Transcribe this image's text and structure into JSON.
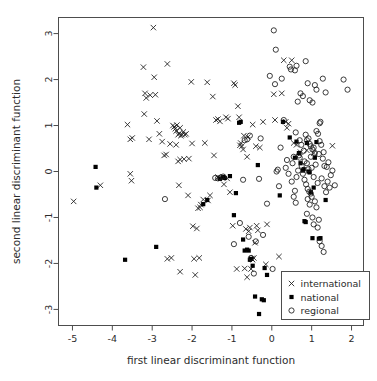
{
  "chart_data": {
    "type": "scatter",
    "title": "",
    "xlabel": "first linear discriminant function",
    "ylabel": "second linear discriminant function",
    "xlim": [
      -5.35,
      2.3
    ],
    "ylim": [
      -3.35,
      3.35
    ],
    "xticks": [
      -5,
      -4,
      -3,
      -2,
      -1,
      0,
      1,
      2
    ],
    "yticks": [
      -3,
      -2,
      -1,
      0,
      1,
      2,
      3
    ],
    "xtick_labels": [
      "-5",
      "-4",
      "-3",
      "-2",
      "-1",
      "0",
      "1",
      "2"
    ],
    "ytick_labels": [
      "-3",
      "-2",
      "-1",
      "0",
      "1",
      "2",
      "3"
    ],
    "grid": false,
    "legend_position": "bottom-right",
    "series": [
      {
        "name": "international",
        "marker": "x",
        "color": "#1a1a1a",
        "points": [
          [
            -4.97,
            -0.65
          ],
          [
            -4.3,
            -0.3
          ],
          [
            -3.62,
            1.02
          ],
          [
            -3.55,
            0.7
          ],
          [
            -3.5,
            0.73
          ],
          [
            -3.52,
            -0.2
          ],
          [
            -3.55,
            -0.05
          ],
          [
            -3.22,
            2.27
          ],
          [
            -3.2,
            1.25
          ],
          [
            -3.18,
            1.7
          ],
          [
            -3.15,
            1.6
          ],
          [
            -3.05,
            1.66
          ],
          [
            -2.97,
            3.13
          ],
          [
            -2.95,
            2.05
          ],
          [
            -2.88,
            1.1
          ],
          [
            -2.82,
            0.82
          ],
          [
            -2.75,
            0.65
          ],
          [
            -2.7,
            0.35
          ],
          [
            -2.65,
            0.37
          ],
          [
            -2.62,
            2.34
          ],
          [
            -2.48,
            1.0
          ],
          [
            -2.45,
            0.97
          ],
          [
            -2.42,
            0.93
          ],
          [
            -2.4,
            0.88
          ],
          [
            -2.38,
            1.01
          ],
          [
            -2.35,
            0.8
          ],
          [
            -2.32,
            0.83
          ],
          [
            -2.3,
            0.95
          ],
          [
            -2.28,
            0.78
          ],
          [
            -2.25,
            0.8
          ],
          [
            -2.22,
            0.86
          ],
          [
            -2.4,
            0.58
          ],
          [
            -2.35,
            0.22
          ],
          [
            -2.3,
            0.26
          ],
          [
            -2.33,
            -0.3
          ],
          [
            -2.2,
            0.27
          ],
          [
            -2.18,
            0.8
          ],
          [
            -2.15,
            0.82
          ],
          [
            -2.1,
            -0.52
          ],
          [
            -2.02,
            1.95
          ],
          [
            -2.0,
            0.61
          ],
          [
            -1.98,
            -1.19
          ],
          [
            -1.88,
            -1.24
          ],
          [
            -1.85,
            -0.8
          ],
          [
            -1.8,
            -0.78
          ],
          [
            -1.78,
            -0.72
          ],
          [
            -1.72,
            -0.61
          ],
          [
            -1.62,
            1.94
          ],
          [
            -1.6,
            -0.63
          ],
          [
            -1.48,
            1.63
          ],
          [
            -1.45,
            0.35
          ],
          [
            -1.4,
            1.12
          ],
          [
            -1.35,
            1.14
          ],
          [
            -1.3,
            1.09
          ],
          [
            -1.2,
            -0.28
          ],
          [
            -1.15,
            1.18
          ],
          [
            -1.1,
            1.15
          ],
          [
            -1.05,
            -0.45
          ],
          [
            -0.95,
            1.92
          ],
          [
            -0.92,
            1.88
          ],
          [
            -0.88,
            -2.12
          ],
          [
            -0.85,
            1.42
          ],
          [
            -0.8,
            0.57
          ],
          [
            -0.78,
            0.62
          ],
          [
            -0.75,
            0.55
          ],
          [
            -0.72,
            0.48
          ],
          [
            -0.7,
            0.78
          ],
          [
            -0.68,
            -2.11
          ],
          [
            -0.65,
            -1.25
          ],
          [
            -0.62,
            -2.3
          ],
          [
            -0.6,
            0.75
          ],
          [
            -0.58,
            -1.3
          ],
          [
            -0.55,
            -1.22
          ],
          [
            -0.52,
            -2.12
          ],
          [
            -0.5,
            -1.9
          ],
          [
            -0.48,
            -1.92
          ],
          [
            -0.45,
            -1.88
          ],
          [
            -0.42,
            -1.55
          ],
          [
            -0.4,
            0.55
          ],
          [
            -0.38,
            -1.18
          ],
          [
            -0.35,
            -1.28
          ],
          [
            -0.3,
            0.52
          ],
          [
            -0.22,
            1.08
          ],
          [
            -0.15,
            -2.02
          ],
          [
            -0.12,
            -1.15
          ],
          [
            0.05,
            1.68
          ],
          [
            0.08,
            1.12
          ],
          [
            0.18,
            -1.85
          ],
          [
            0.25,
            1.7
          ],
          [
            0.3,
            2.42
          ],
          [
            0.35,
            1.08
          ],
          [
            0.38,
            0.95
          ],
          [
            0.42,
            1.04
          ],
          [
            0.5,
            2.42
          ],
          [
            0.55,
            0.62
          ],
          [
            0.62,
            0.58
          ],
          [
            0.72,
            0.42
          ],
          [
            0.88,
            0.46
          ],
          [
            1.05,
            0.4
          ],
          [
            1.52,
            0.56
          ],
          [
            -2.92,
            1.67
          ],
          [
            -2.55,
            0.6
          ],
          [
            -1.92,
            -2.25
          ],
          [
            -1.82,
            -1.88
          ],
          [
            -2.3,
            -2.18
          ],
          [
            -2.62,
            -1.9
          ],
          [
            -2.52,
            -1.88
          ],
          [
            -1.95,
            -1.9
          ],
          [
            -0.98,
            -1.18
          ],
          [
            -1.12,
            -0.15
          ],
          [
            -0.82,
            1.18
          ],
          [
            -1.55,
            -0.52
          ],
          [
            -3.08,
            0.7
          ],
          [
            -2.08,
            0.28
          ],
          [
            -1.68,
            0.62
          ],
          [
            -1.35,
            -0.12
          ],
          [
            -0.62,
            0.32
          ],
          [
            -0.48,
            1.02
          ]
        ]
      },
      {
        "name": "national",
        "marker": "square",
        "color": "#000000",
        "points": [
          [
            -4.42,
            0.1
          ],
          [
            -4.4,
            -0.35
          ],
          [
            -3.68,
            -1.92
          ],
          [
            -2.9,
            -1.64
          ],
          [
            -1.72,
            -0.71
          ],
          [
            -1.62,
            -0.62
          ],
          [
            -1.3,
            -0.16
          ],
          [
            -1.22,
            -0.12
          ],
          [
            -1.18,
            -0.14
          ],
          [
            -1.05,
            -0.1
          ],
          [
            -0.95,
            -0.95
          ],
          [
            -0.9,
            -0.47
          ],
          [
            -0.82,
            1.06
          ],
          [
            -0.78,
            1.08
          ],
          [
            -0.72,
            -1.48
          ],
          [
            -0.62,
            -1.7
          ],
          [
            -0.58,
            -1.72
          ],
          [
            -0.55,
            -1.92
          ],
          [
            -0.52,
            -1.9
          ],
          [
            -0.48,
            -2.05
          ],
          [
            -0.42,
            -2.72
          ],
          [
            -0.35,
            0.14
          ],
          [
            -0.32,
            -3.1
          ],
          [
            -0.25,
            -2.78
          ],
          [
            -0.2,
            -2.8
          ],
          [
            -0.18,
            -2.1
          ],
          [
            -0.12,
            -2.25
          ],
          [
            0.2,
            -0.52
          ],
          [
            0.28,
            1.08
          ],
          [
            0.45,
            0.74
          ],
          [
            0.62,
            0.65
          ],
          [
            0.68,
            0.4
          ],
          [
            0.72,
            0.18
          ],
          [
            0.78,
            0.02
          ],
          [
            0.8,
            0.05
          ],
          [
            0.82,
            -1.08
          ],
          [
            0.85,
            -1.1
          ],
          [
            0.88,
            0.62
          ],
          [
            0.92,
            0.0
          ],
          [
            0.95,
            -0.02
          ],
          [
            0.98,
            -0.45
          ],
          [
            1.02,
            -1.45
          ],
          [
            1.05,
            -0.35
          ],
          [
            1.08,
            0.3
          ],
          [
            1.12,
            0.64
          ],
          [
            1.18,
            -1.46
          ],
          [
            1.22,
            -1.45
          ],
          [
            1.35,
            -0.62
          ],
          [
            -0.68,
            -1.72
          ],
          [
            0.58,
            0.3
          ]
        ]
      },
      {
        "name": "regional",
        "marker": "circle",
        "color": "#1a1a1a",
        "points": [
          [
            -2.68,
            -0.6
          ],
          [
            -1.42,
            -0.14
          ],
          [
            -1.35,
            -0.15
          ],
          [
            -1.28,
            -0.13
          ],
          [
            -1.22,
            -0.11
          ],
          [
            -0.95,
            -1.58
          ],
          [
            -0.8,
            -1.12
          ],
          [
            -0.72,
            -0.18
          ],
          [
            -0.68,
            0.68
          ],
          [
            -0.62,
            0.7
          ],
          [
            -0.58,
            -1.42
          ],
          [
            -0.55,
            0.78
          ],
          [
            -0.52,
            -1.88
          ],
          [
            -0.45,
            -2.22
          ],
          [
            -0.4,
            -1.52
          ],
          [
            -0.32,
            -0.16
          ],
          [
            -0.28,
            0.72
          ],
          [
            -0.22,
            -1.38
          ],
          [
            -0.12,
            -0.7
          ],
          [
            -0.05,
            2.08
          ],
          [
            0.02,
            -2.12
          ],
          [
            0.05,
            3.07
          ],
          [
            0.08,
            1.9
          ],
          [
            0.1,
            2.65
          ],
          [
            0.12,
            0.0
          ],
          [
            0.15,
            0.04
          ],
          [
            0.18,
            -0.32
          ],
          [
            0.22,
            0.52
          ],
          [
            0.25,
            2.02
          ],
          [
            0.3,
            1.12
          ],
          [
            0.35,
            0.08
          ],
          [
            0.38,
            0.25
          ],
          [
            0.42,
            -0.05
          ],
          [
            0.45,
            2.28
          ],
          [
            0.48,
            2.22
          ],
          [
            0.52,
            0.18
          ],
          [
            0.55,
            -0.55
          ],
          [
            0.58,
            2.2
          ],
          [
            0.6,
            -0.68
          ],
          [
            0.62,
            2.3
          ],
          [
            0.65,
            1.52
          ],
          [
            0.68,
            0.35
          ],
          [
            0.7,
            0.3
          ],
          [
            0.72,
            1.7
          ],
          [
            0.75,
            0.12
          ],
          [
            0.78,
            1.64
          ],
          [
            0.8,
            0.45
          ],
          [
            0.82,
            0.22
          ],
          [
            0.85,
            2.4
          ],
          [
            0.88,
            0.18
          ],
          [
            0.9,
            1.92
          ],
          [
            0.92,
            0.05
          ],
          [
            0.95,
            1.55
          ],
          [
            0.98,
            0.32
          ],
          [
            1.0,
            0.08
          ],
          [
            1.02,
            1.5
          ],
          [
            1.05,
            -0.12
          ],
          [
            1.08,
            1.88
          ],
          [
            1.1,
            0.15
          ],
          [
            1.12,
            1.78
          ],
          [
            1.15,
            -0.25
          ],
          [
            1.18,
            0.38
          ],
          [
            1.2,
            1.05
          ],
          [
            1.22,
            1.08
          ],
          [
            1.25,
            -0.15
          ],
          [
            1.28,
            2.02
          ],
          [
            1.3,
            0.42
          ],
          [
            1.32,
            -0.32
          ],
          [
            1.35,
            1.72
          ],
          [
            1.38,
            0.1
          ],
          [
            1.4,
            -0.22
          ],
          [
            1.42,
            0.2
          ],
          [
            1.45,
            -0.35
          ],
          [
            1.48,
            -0.08
          ],
          [
            1.52,
            0.02
          ],
          [
            1.58,
            -0.3
          ],
          [
            1.8,
            2.0
          ],
          [
            1.9,
            1.78
          ],
          [
            0.9,
            -0.6
          ],
          [
            0.95,
            -0.72
          ],
          [
            0.98,
            -0.48
          ],
          [
            1.0,
            -0.55
          ],
          [
            1.02,
            -1.0
          ],
          [
            1.05,
            -1.15
          ],
          [
            1.08,
            -0.65
          ],
          [
            1.12,
            -0.78
          ],
          [
            1.15,
            -1.22
          ],
          [
            1.18,
            -1.05
          ],
          [
            1.2,
            -1.52
          ],
          [
            1.25,
            -1.62
          ],
          [
            1.3,
            -1.75
          ],
          [
            0.85,
            0.8
          ],
          [
            0.88,
            0.68
          ],
          [
            0.92,
            0.72
          ],
          [
            0.95,
            0.6
          ],
          [
            0.98,
            0.55
          ],
          [
            1.02,
            0.48
          ],
          [
            1.05,
            0.52
          ],
          [
            1.08,
            0.4
          ],
          [
            0.78,
            -0.05
          ],
          [
            0.82,
            -0.18
          ],
          [
            0.86,
            -0.28
          ],
          [
            0.9,
            -0.38
          ],
          [
            0.94,
            -0.44
          ],
          [
            0.74,
            0.58
          ],
          [
            0.7,
            0.68
          ],
          [
            0.66,
            0.02
          ],
          [
            0.62,
            -0.12
          ],
          [
            0.58,
            -0.42
          ],
          [
            0.55,
            0.32
          ],
          [
            0.5,
            -0.22
          ],
          [
            1.12,
            0.88
          ],
          [
            1.16,
            0.82
          ],
          [
            1.2,
            0.66
          ],
          [
            1.24,
            0.58
          ],
          [
            1.28,
            0.28
          ],
          [
            1.32,
            0.12
          ],
          [
            1.36,
            -0.45
          ],
          [
            0.88,
            -0.92
          ],
          [
            0.6,
            0.85
          ]
        ]
      }
    ],
    "legend": [
      {
        "label": "international",
        "marker": "x"
      },
      {
        "label": "national",
        "marker": "square"
      },
      {
        "label": "regional",
        "marker": "circle"
      }
    ]
  }
}
